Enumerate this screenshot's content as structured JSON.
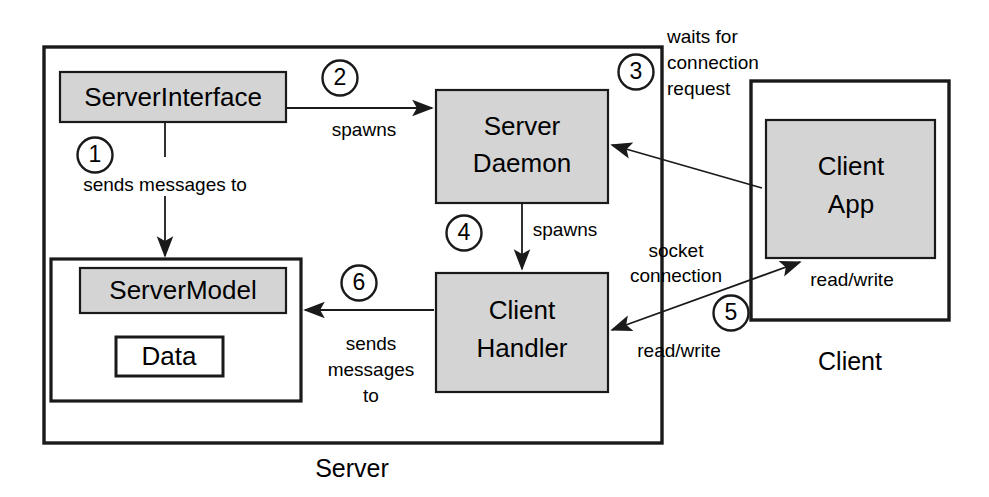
{
  "diagram": {
    "title_hidden": "Client-Server architecture diagram",
    "containers": [
      {
        "id": "server",
        "label": "Server"
      },
      {
        "id": "client",
        "label": "Client"
      }
    ],
    "boxes": {
      "server_interface": "ServerInterface",
      "server_model": "ServerModel",
      "data": "Data",
      "server_daemon_line1": "Server",
      "server_daemon_line2": "Daemon",
      "client_handler_line1": "Client",
      "client_handler_line2": "Handler",
      "client_app_line1": "Client",
      "client_app_line2": "App"
    },
    "steps": [
      {
        "number": "1",
        "label": "sends messages to"
      },
      {
        "number": "2",
        "label": "spawns"
      },
      {
        "number": "3",
        "label_line1": "waits for",
        "label_line2": "connection",
        "label_line3": "request"
      },
      {
        "number": "4",
        "label": "spawns"
      },
      {
        "number": "5",
        "label_line1": "socket",
        "label_line2": "connection"
      },
      {
        "number": "6",
        "label_line1": "sends",
        "label_line2": "messages",
        "label_line3": "to"
      }
    ],
    "edge_labels": {
      "read_write_client": "read/write",
      "read_write_handler": "read/write"
    },
    "colors": {
      "box_gray": "#d4d4d4",
      "stroke": "#1a1a1a",
      "background": "#ffffff"
    }
  }
}
